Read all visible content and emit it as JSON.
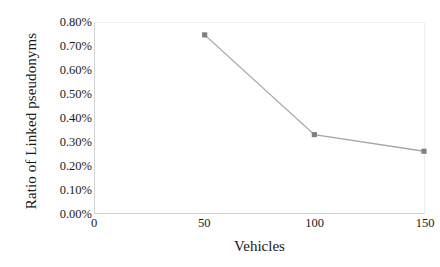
{
  "chart_data": {
    "type": "line",
    "title": "",
    "xlabel": "Vehicles",
    "ylabel": "Ratio of Linked pseudonyms",
    "x": [
      50,
      100,
      150
    ],
    "values": [
      0.75,
      0.33,
      0.26
    ],
    "value_labels": [
      "0.75%",
      "0.33%",
      "0.26%"
    ],
    "xlim": [
      0,
      150
    ],
    "ylim": [
      0,
      0.8
    ],
    "xticks": [
      0,
      50,
      100,
      150
    ],
    "xtick_labels": [
      "0",
      "50",
      "100",
      "150"
    ],
    "yticks": [
      0,
      0.1,
      0.2,
      0.3,
      0.4,
      0.5,
      0.6,
      0.7,
      0.8
    ],
    "ytick_labels": [
      "0.00%",
      "0.10%",
      "0.20%",
      "0.30%",
      "0.40%",
      "0.50%",
      "0.60%",
      "0.70%",
      "0.80%"
    ],
    "grid": false,
    "legend": null,
    "series_name": "Ratio of Linked pseudonyms",
    "line_color": "#a6a6a6",
    "marker_color": "#808080",
    "marker_shape": "square",
    "axis_color": "#d2d2d2",
    "background_color": "#ffffff",
    "text_color": "#1a1a1a"
  }
}
